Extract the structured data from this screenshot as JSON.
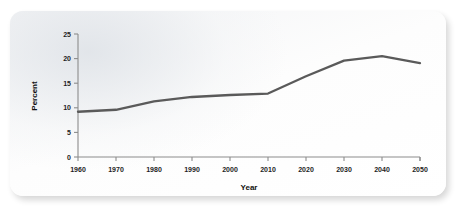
{
  "chart_data": {
    "type": "line",
    "title": "",
    "xlabel": "Year",
    "ylabel": "Percent",
    "x": [
      1960,
      1970,
      1980,
      1990,
      2000,
      2010,
      2020,
      2030,
      2040,
      2050
    ],
    "values": [
      9.2,
      9.6,
      11.3,
      12.2,
      12.6,
      12.9,
      16.4,
      19.6,
      20.5,
      19.1
    ],
    "series": [
      {
        "name": "Percent",
        "values": [
          9.2,
          9.6,
          11.3,
          12.2,
          12.6,
          12.9,
          16.4,
          19.6,
          20.5,
          19.1
        ]
      }
    ],
    "xticklabels": [
      "1960",
      "1970",
      "1980",
      "1990",
      "2000",
      "2010",
      "2020",
      "2030",
      "2040",
      "2050"
    ],
    "yticklabels": [
      "0",
      "5",
      "10",
      "15",
      "20",
      "25"
    ],
    "yticks": [
      0,
      5,
      10,
      15,
      20,
      25
    ],
    "xlim": [
      1960,
      2050
    ],
    "ylim": [
      0,
      25
    ],
    "grid": false,
    "legend": false,
    "legend_position": "none",
    "line_color": "#5a5a5a",
    "axis_color": "#8c8c8c",
    "background_color": "#fbfbfb"
  }
}
